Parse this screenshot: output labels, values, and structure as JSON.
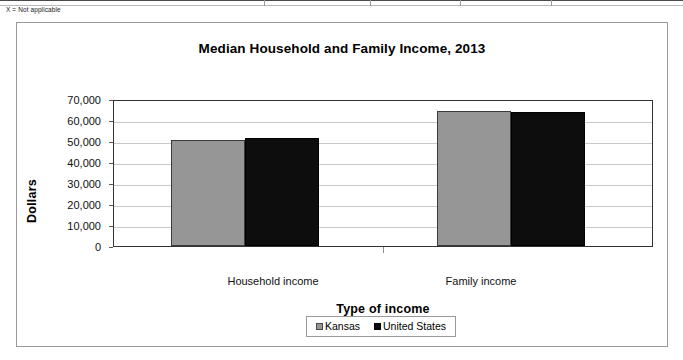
{
  "footnote": "X = Not applicable",
  "chart_data": {
    "type": "bar",
    "title": "Median Household and Family Income, 2013",
    "xlabel": "Type of income",
    "ylabel": "Dollars",
    "categories": [
      "Household income",
      "Family income"
    ],
    "series": [
      {
        "name": "Kansas",
        "color": "#969696",
        "values": [
          51000,
          65400
        ]
      },
      {
        "name": "United States",
        "color": "#0d0d0d",
        "values": [
          52000,
          64700
        ]
      }
    ],
    "ylim": [
      0,
      70000
    ],
    "ytick_values": [
      0,
      10000,
      20000,
      30000,
      40000,
      50000,
      60000,
      70000
    ],
    "ytick_labels": [
      "0",
      "10,000",
      "20,000",
      "30,000",
      "40,000",
      "50,000",
      "60,000",
      "70,000"
    ],
    "grid": true,
    "legend_position": "bottom"
  }
}
